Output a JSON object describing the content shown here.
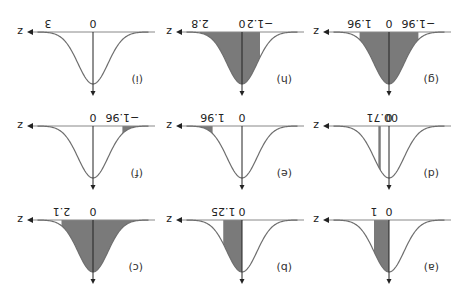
{
  "figure": {
    "orientation": "rotated-180",
    "axis_label": "z",
    "shade_color": "#7a7a7a",
    "curve_color": "#6e6e6e",
    "axis_color": "#888888"
  },
  "panels": [
    {
      "id": "a",
      "label": "(a)",
      "ticks": [
        {
          "z": 0,
          "text": "0"
        },
        {
          "z": 1,
          "text": "1"
        }
      ],
      "shade": [
        0,
        1
      ]
    },
    {
      "id": "b",
      "label": "(b)",
      "ticks": [
        {
          "z": 0,
          "text": "0"
        },
        {
          "z": 1.25,
          "text": "1.25"
        }
      ],
      "shade": [
        0,
        1.25
      ]
    },
    {
      "id": "c",
      "label": "(c)",
      "ticks": [
        {
          "z": 0,
          "text": "0"
        },
        {
          "z": 2.1,
          "text": "2.1"
        }
      ],
      "shade": [
        -4,
        2.1
      ]
    },
    {
      "id": "d",
      "label": "(d)",
      "ticks": [
        {
          "z": 0,
          "text": "0"
        },
        {
          "z": 0.71,
          "text": "0.71"
        }
      ],
      "shade": [
        0.55,
        0.71
      ],
      "tick_text": "00.71"
    },
    {
      "id": "e",
      "label": "(e)",
      "ticks": [
        {
          "z": 0,
          "text": "0"
        },
        {
          "z": 1.96,
          "text": "1.96"
        }
      ],
      "shade": [
        1.96,
        4
      ]
    },
    {
      "id": "f",
      "label": "(f)",
      "ticks": [
        {
          "z": 0,
          "text": "0"
        },
        {
          "z": -1.96,
          "text": "−1.96"
        }
      ],
      "shade": [
        -4,
        -1.96
      ]
    },
    {
      "id": "g",
      "label": "(g)",
      "ticks": [
        {
          "z": -1.96,
          "text": "−1.96"
        },
        {
          "z": 0,
          "text": "0"
        },
        {
          "z": 1.96,
          "text": "1.96"
        }
      ],
      "shade": [
        -1.96,
        1.96
      ]
    },
    {
      "id": "h",
      "label": "(h)",
      "ticks": [
        {
          "z": -1.2,
          "text": "−1.2"
        },
        {
          "z": 0,
          "text": "0"
        },
        {
          "z": 2.8,
          "text": "2.8"
        }
      ],
      "shade": [
        -1.2,
        2.8
      ]
    },
    {
      "id": "i",
      "label": "(i)",
      "ticks": [
        {
          "z": 0,
          "text": "0"
        },
        {
          "z": 3,
          "text": "3"
        }
      ],
      "shade": null
    }
  ],
  "chart_data": {
    "type": "area",
    "xlabel": "z",
    "panels": [
      {
        "label": "(a)",
        "shaded_interval": [
          0,
          1
        ]
      },
      {
        "label": "(b)",
        "shaded_interval": [
          0,
          1.25
        ]
      },
      {
        "label": "(c)",
        "shaded_interval": [
          "-inf",
          2.1
        ]
      },
      {
        "label": "(d)",
        "shaded_interval": [
          0.6,
          0.71
        ]
      },
      {
        "label": "(e)",
        "shaded_interval": [
          1.96,
          "inf"
        ]
      },
      {
        "label": "(f)",
        "shaded_interval": [
          "-inf",
          -1.96
        ]
      },
      {
        "label": "(g)",
        "shaded_interval": [
          -1.96,
          1.96
        ]
      },
      {
        "label": "(h)",
        "shaded_interval": [
          -1.2,
          2.8
        ]
      },
      {
        "label": "(i)",
        "marked_value": 3,
        "shaded_interval": null
      }
    ]
  }
}
